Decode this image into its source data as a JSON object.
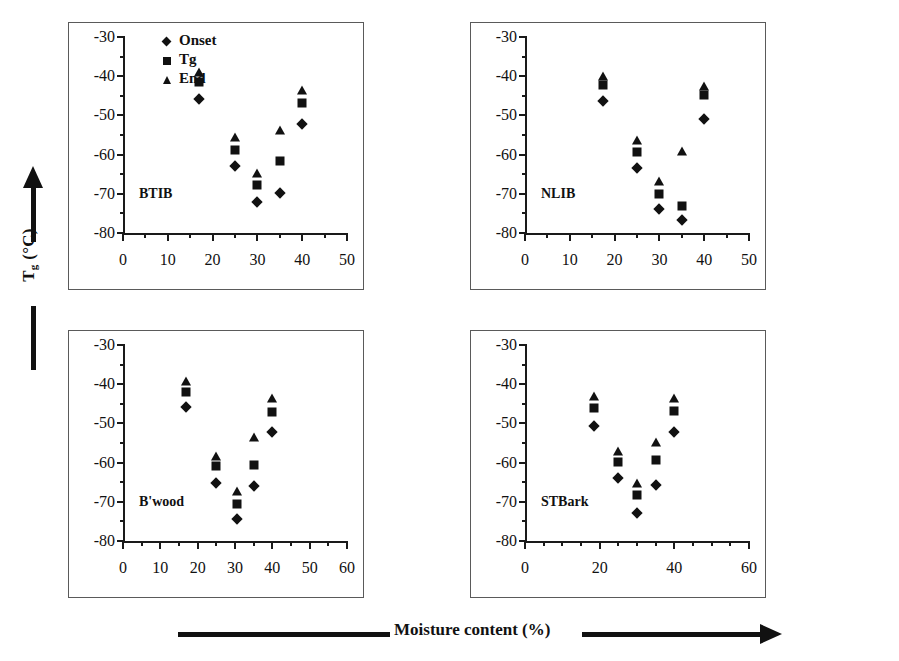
{
  "figure": {
    "axis_super_label_y": "Tg (°C)",
    "axis_super_label_y_main": "T",
    "axis_super_label_y_sub": "g",
    "axis_super_label_y_unit": " (°C)",
    "axis_super_label_x": "Moisture content (%)"
  },
  "legend": {
    "title": "",
    "items": [
      {
        "label": "Onset",
        "marker": "diamond-marker"
      },
      {
        "label": "Tg",
        "marker": "square-marker"
      },
      {
        "label": "End",
        "marker": "triangle-marker"
      }
    ]
  },
  "chart_data": [
    {
      "type": "scatter",
      "title": "BTIB",
      "xlabel": "Moisture content (%)",
      "ylabel": "Tg (°C)",
      "xlim": [
        0,
        50
      ],
      "ylim": [
        -80,
        -30
      ],
      "xticks": [
        0,
        10,
        20,
        30,
        40,
        50
      ],
      "xtick_labels": [
        "0",
        "10",
        "20",
        "30",
        "40",
        "50"
      ],
      "xminor_step": 5,
      "yticks": [
        -80,
        -70,
        -60,
        -50,
        -40,
        -30
      ],
      "ytick_labels": [
        "-80",
        "-70",
        "-60",
        "-50",
        "-40",
        "-30"
      ],
      "yminor_step": 5,
      "grid": false,
      "legend_position": "top-left-inside",
      "x": [
        17,
        25,
        30,
        35,
        40
      ],
      "series": [
        {
          "name": "Onset",
          "marker": "diamond",
          "values": [
            -45.8,
            -63.0,
            -72.0,
            -69.8,
            -52.3
          ]
        },
        {
          "name": "Tg",
          "marker": "square",
          "values": [
            -41.5,
            -58.8,
            -67.8,
            -61.6,
            -46.8
          ]
        },
        {
          "name": "End",
          "marker": "triangle",
          "values": [
            -39.0,
            -55.6,
            -64.8,
            -53.8,
            -43.5
          ]
        }
      ]
    },
    {
      "type": "scatter",
      "title": "NLIB",
      "xlabel": "Moisture content (%)",
      "ylabel": "Tg (°C)",
      "xlim": [
        0,
        50
      ],
      "ylim": [
        -80,
        -30
      ],
      "xticks": [
        0,
        10,
        20,
        30,
        40,
        50
      ],
      "xtick_labels": [
        "0",
        "10",
        "20",
        "30",
        "40",
        "50"
      ],
      "xminor_step": 5,
      "yticks": [
        -80,
        -70,
        -60,
        -50,
        -40,
        -30
      ],
      "ytick_labels": [
        "-80",
        "-70",
        "-60",
        "-50",
        "-40",
        "-30"
      ],
      "yminor_step": 5,
      "grid": false,
      "legend_position": "none",
      "x": [
        17.5,
        25,
        30,
        35,
        40
      ],
      "series": [
        {
          "name": "Onset",
          "marker": "diamond",
          "values": [
            -46.2,
            -63.5,
            -73.8,
            -76.6,
            -51.0
          ]
        },
        {
          "name": "Tg",
          "marker": "square",
          "values": [
            -42.3,
            -59.3,
            -70.0,
            -73.0,
            -44.9
          ]
        },
        {
          "name": "End",
          "marker": "triangle",
          "values": [
            -39.9,
            -56.3,
            -66.8,
            -59.0,
            -42.5
          ]
        }
      ]
    },
    {
      "type": "scatter",
      "title": "B'wood",
      "xlabel": "Moisture content (%)",
      "ylabel": "Tg (°C)",
      "xlim": [
        0,
        60
      ],
      "ylim": [
        -80,
        -30
      ],
      "xticks": [
        0,
        10,
        20,
        30,
        40,
        50,
        60
      ],
      "xtick_labels": [
        "0",
        "10",
        "20",
        "30",
        "40",
        "50",
        "60"
      ],
      "xminor_step": 5,
      "yticks": [
        -80,
        -70,
        -60,
        -50,
        -40,
        -30
      ],
      "ytick_labels": [
        "-80",
        "-70",
        "-60",
        "-50",
        "-40",
        "-30"
      ],
      "yminor_step": 5,
      "grid": false,
      "legend_position": "none",
      "x": [
        17,
        25,
        30.5,
        35,
        40
      ],
      "series": [
        {
          "name": "Onset",
          "marker": "diamond",
          "values": [
            -45.8,
            -65.2,
            -74.5,
            -65.9,
            -52.2
          ]
        },
        {
          "name": "Tg",
          "marker": "square",
          "values": [
            -41.9,
            -60.9,
            -70.6,
            -60.5,
            -47.2
          ]
        },
        {
          "name": "End",
          "marker": "triangle",
          "values": [
            -39.3,
            -58.2,
            -67.3,
            -53.5,
            -43.6
          ]
        }
      ]
    },
    {
      "type": "scatter",
      "title": "STBark",
      "xlabel": "Moisture content (%)",
      "ylabel": "Tg (°C)",
      "xlim": [
        0,
        60
      ],
      "ylim": [
        -80,
        -30
      ],
      "xticks": [
        0,
        20,
        40,
        60
      ],
      "xtick_labels": [
        "0",
        "20",
        "40",
        "60"
      ],
      "xminor_step": 5,
      "yticks": [
        -80,
        -70,
        -60,
        -50,
        -40,
        -30
      ],
      "ytick_labels": [
        "-80",
        "-70",
        "-60",
        "-50",
        "-40",
        "-30"
      ],
      "yminor_step": 5,
      "grid": false,
      "legend_position": "none",
      "x": [
        18.5,
        25,
        30,
        35,
        40
      ],
      "series": [
        {
          "name": "Onset",
          "marker": "diamond",
          "values": [
            -50.6,
            -64.0,
            -72.8,
            -65.8,
            -52.1
          ]
        },
        {
          "name": "Tg",
          "marker": "square",
          "values": [
            -46.0,
            -59.9,
            -68.3,
            -59.4,
            -46.8
          ]
        },
        {
          "name": "End",
          "marker": "triangle",
          "values": [
            -43.0,
            -57.0,
            -65.2,
            -54.7,
            -43.5
          ]
        }
      ]
    }
  ]
}
